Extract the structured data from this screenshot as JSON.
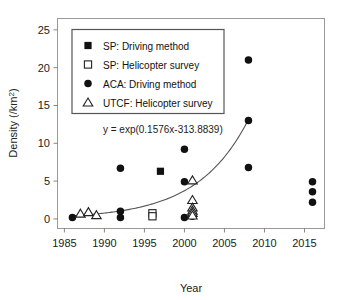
{
  "chart_data": {
    "type": "scatter",
    "title": "",
    "xlabel": "Year",
    "ylabel": "Density (/km²)",
    "xlim": [
      1984.2,
      2017.5
    ],
    "ylim": [
      -1.2,
      26.5
    ],
    "xticks": [
      1985,
      1990,
      1995,
      2000,
      2005,
      2010,
      2015
    ],
    "xticklabels": [
      "1985",
      "1990",
      "1995",
      "2000",
      "2005",
      "2010",
      "2015"
    ],
    "yticks": [
      0,
      5,
      10,
      15,
      20,
      25
    ],
    "yticklabels": [
      "0",
      "5",
      "10",
      "15",
      "20",
      "25"
    ],
    "grid": false,
    "legend_position": "upper-left-inset",
    "series": [
      {
        "name": "SP: Driving method",
        "key": "sp_driving",
        "marker": "filled-square",
        "color": "#111111",
        "points": [
          [
            1997,
            6.3
          ]
        ]
      },
      {
        "name": "SP: Helicopter survey",
        "key": "sp_helicopter",
        "marker": "open-square",
        "color": "#222222",
        "points": [
          [
            1996,
            0.75
          ],
          [
            1996,
            0.35
          ]
        ]
      },
      {
        "name": "ACA: Driving method",
        "key": "aca_driving",
        "marker": "filled-circle",
        "color": "#111111",
        "points": [
          [
            1986,
            0.2
          ],
          [
            1992,
            6.7
          ],
          [
            1992,
            1.0
          ],
          [
            1992,
            0.2
          ],
          [
            2000,
            9.2
          ],
          [
            2000,
            4.9
          ],
          [
            2000,
            0.2
          ],
          [
            2001,
            0.35
          ],
          [
            2008,
            21.0
          ],
          [
            2008,
            13.0
          ],
          [
            2008,
            6.8
          ],
          [
            2016,
            4.9
          ],
          [
            2016,
            3.6
          ],
          [
            2016,
            2.2
          ]
        ]
      },
      {
        "name": "UTCF: Helicopter survey",
        "key": "utcf_helicopter",
        "marker": "open-triangle",
        "color": "#222222",
        "points": [
          [
            1987,
            0.7
          ],
          [
            1988,
            0.9
          ],
          [
            1989,
            0.5
          ],
          [
            2001,
            5.1
          ],
          [
            2001,
            2.5
          ],
          [
            2001,
            1.5
          ],
          [
            2001,
            1.1
          ],
          [
            2001,
            0.8
          ],
          [
            2001,
            0.45
          ]
        ]
      }
    ],
    "fit": {
      "equation_label": "y = exp(0.1576x-313.8839)",
      "slope": 0.1576,
      "intercept": -313.8839,
      "x_start": 1986,
      "x_end": 2008,
      "color": "#555555"
    },
    "annotations": [
      {
        "text": "y = exp(0.1576x-313.8839)",
        "x": 1997.3,
        "y": 11.3
      }
    ]
  },
  "legend": {
    "items": [
      {
        "label": "SP: Driving method",
        "marker": "filled-square"
      },
      {
        "label": "SP: Helicopter survey",
        "marker": "open-square"
      },
      {
        "label": "ACA: Driving method",
        "marker": "filled-circle"
      },
      {
        "label": "UTCF: Helicopter survey",
        "marker": "open-triangle"
      }
    ]
  }
}
